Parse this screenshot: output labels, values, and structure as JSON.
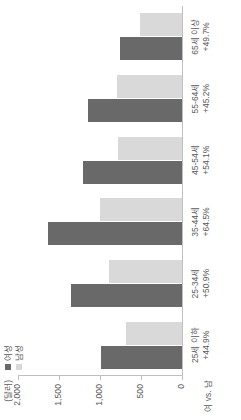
{
  "chart_data": {
    "type": "bar",
    "title": "",
    "subtitle": "",
    "orientation": "vertical",
    "unit_label": "(달러)",
    "xlabel": "여 vs. 남",
    "ylabel": "",
    "ylim": [
      0,
      2000
    ],
    "yticks": [
      0,
      500,
      1000,
      1500,
      2000
    ],
    "ytick_labels": [
      "0",
      "500",
      "1,000",
      "1,500",
      "2,000"
    ],
    "grid": false,
    "legend_position": "top-left",
    "categories": [
      "25세 이하",
      "25-34세",
      "35-44세",
      "45-54세",
      "55-64세",
      "65세 이상"
    ],
    "category_sublabels": [
      "+44.9%",
      "+50.9%",
      "+64.5%",
      "+54.1%",
      "+45.2%",
      "+49.7%"
    ],
    "series": [
      {
        "name": "여성",
        "color": "#696969",
        "values": [
          990,
          1350,
          1640,
          1210,
          1150,
          760
        ]
      },
      {
        "name": "남성",
        "color": "#d9d9d9",
        "values": [
          683,
          895,
          997,
          785,
          792,
          508
        ]
      }
    ]
  }
}
